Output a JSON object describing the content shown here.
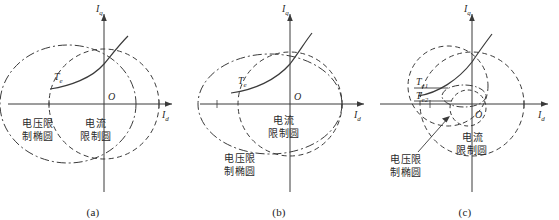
{
  "figure": {
    "title": "",
    "background": "#ffffff",
    "line_color": "#3a3a3a",
    "axis_color": "#3a3a3a"
  },
  "axes": {
    "y_label": "I",
    "y_sub": "q",
    "x_label": "I",
    "x_sub": "d",
    "origin_label": "O"
  },
  "panels": [
    {
      "id": "a",
      "caption": "(a)",
      "torque_label": {
        "base": "T",
        "sub": "e"
      },
      "annotations": [
        {
          "name": "voltage-limit-ellipse-label",
          "line1": "电压限",
          "line2": "制椭圆"
        },
        {
          "name": "current-limit-circle-label",
          "line1": "电流",
          "line2": "限制圆"
        }
      ]
    },
    {
      "id": "b",
      "caption": "(b)",
      "torque_label": {
        "base": "T",
        "sub": "e"
      },
      "annotations": [
        {
          "name": "current-limit-circle-label",
          "line1": "电流",
          "line2": "限制圆"
        },
        {
          "name": "voltage-limit-ellipse-label",
          "line1": "电压限",
          "line2": "制椭圆"
        }
      ]
    },
    {
      "id": "c",
      "caption": "(c)",
      "torque_labels": [
        {
          "base": "T",
          "sub": "e1"
        },
        {
          "base": "T",
          "sub": "e2"
        }
      ],
      "annotations": [
        {
          "name": "current-limit-circle-label",
          "line1": "电流",
          "line2": "限制圆"
        },
        {
          "name": "voltage-limit-ellipse-label",
          "line1": "电压限",
          "line2": "制椭圆"
        }
      ]
    }
  ],
  "legend_terms": {
    "voltage_limit_ellipse": "电压限制椭圆",
    "current_limit_circle": "电流限制圆",
    "torque": "T_e"
  }
}
